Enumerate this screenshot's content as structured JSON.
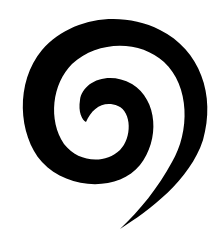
{
  "image": {
    "subject": "spiral",
    "colors": {
      "background": "#ffffff",
      "spiral": "#000000"
    }
  }
}
